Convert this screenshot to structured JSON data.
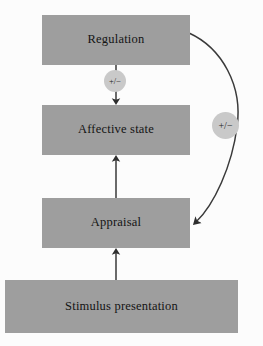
{
  "diagram": {
    "background_color": "#fcfcfc",
    "box_color": "#9e9e9e",
    "badge_color": "#c9c9c9",
    "line_color": "#3a3a3a",
    "text_color": "#141414",
    "nodes": [
      {
        "id": "regulation",
        "label": "Regulation"
      },
      {
        "id": "affective_state",
        "label": "Affective state"
      },
      {
        "id": "appraisal",
        "label": "Appraisal"
      },
      {
        "id": "stimulus_presentation",
        "label": "Stimulus presentation"
      }
    ],
    "edges": [
      {
        "id": "regulation_to_affective_state",
        "from": "regulation",
        "to": "affective_state",
        "style": "straight",
        "direction": "down",
        "badge": "+/−"
      },
      {
        "id": "appraisal_to_affective_state",
        "from": "appraisal",
        "to": "affective_state",
        "style": "straight",
        "direction": "up",
        "badge": ""
      },
      {
        "id": "stimulus_to_appraisal",
        "from": "stimulus_presentation",
        "to": "appraisal",
        "style": "straight",
        "direction": "up",
        "badge": ""
      },
      {
        "id": "regulation_to_appraisal",
        "from": "regulation",
        "to": "appraisal",
        "style": "curved",
        "direction": "down",
        "badge": "+/−"
      }
    ],
    "badges": {
      "regulation_affective": "+/−",
      "regulation_appraisal": "+/−"
    }
  }
}
